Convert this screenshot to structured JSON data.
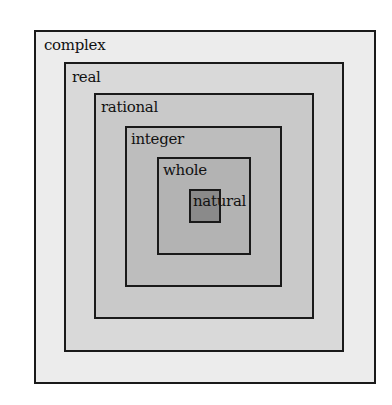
{
  "diagram": {
    "title": "",
    "sets": [
      {
        "name": "complex",
        "label": "complex",
        "color": "#ececec",
        "rect": [
          34,
          30,
          342,
          354
        ],
        "label_pos": [
          8,
          6
        ]
      },
      {
        "name": "real",
        "label": "real",
        "color": "#d9d9d9",
        "rect": [
          64,
          62,
          280,
          290
        ],
        "label_pos": [
          6,
          6
        ]
      },
      {
        "name": "rational",
        "label": "rational",
        "color": "#c9c9c9",
        "rect": [
          94,
          93,
          220,
          226
        ],
        "label_pos": [
          5,
          5
        ]
      },
      {
        "name": "integer",
        "label": "integer",
        "color": "#bdbdbd",
        "rect": [
          125,
          126,
          157,
          161
        ],
        "label_pos": [
          4,
          4
        ]
      },
      {
        "name": "whole",
        "label": "whole",
        "color": "#b3b3b3",
        "rect": [
          157,
          157,
          94,
          98
        ],
        "label_pos": [
          4,
          4
        ]
      },
      {
        "name": "natural",
        "label": "natural",
        "color": "#8a8a8a",
        "rect": [
          189,
          189,
          32,
          34
        ],
        "label_pos": [
          2,
          3
        ]
      }
    ]
  }
}
